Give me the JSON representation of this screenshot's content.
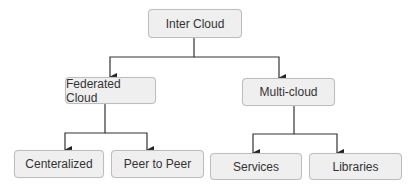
{
  "diagram": {
    "type": "tree",
    "nodes": {
      "root": "Inter Cloud",
      "federated": "Federated Cloud",
      "multi": "Multi-cloud",
      "centeralized": "Centeralized",
      "p2p": "Peer to Peer",
      "services": "Services",
      "libraries": "Libraries"
    },
    "edges": [
      [
        "Inter Cloud",
        "Federated Cloud"
      ],
      [
        "Inter Cloud",
        "Multi-cloud"
      ],
      [
        "Federated Cloud",
        "Centeralized"
      ],
      [
        "Federated Cloud",
        "Peer to Peer"
      ],
      [
        "Multi-cloud",
        "Services"
      ],
      [
        "Multi-cloud",
        "Libraries"
      ]
    ]
  }
}
